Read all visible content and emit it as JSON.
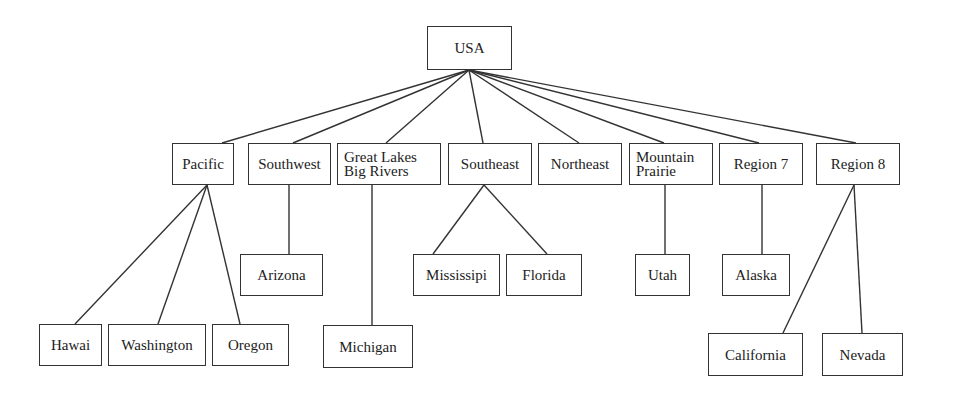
{
  "diagram": {
    "type": "tree",
    "root": "USA",
    "nodes": [
      {
        "id": "usa",
        "label": "USA",
        "x": 427,
        "y": 26,
        "w": 85,
        "h": 44
      },
      {
        "id": "pacific",
        "label": "Pacific",
        "x": 172,
        "y": 143,
        "w": 62,
        "h": 42
      },
      {
        "id": "southwest",
        "label": "Southwest",
        "x": 248,
        "y": 143,
        "w": 83,
        "h": 42
      },
      {
        "id": "greatlakes",
        "label": "Great Lakes",
        "label2": "Big Rivers",
        "x": 337,
        "y": 143,
        "w": 104,
        "h": 42
      },
      {
        "id": "southeast",
        "label": "Southeast",
        "x": 448,
        "y": 143,
        "w": 84,
        "h": 42
      },
      {
        "id": "northeast",
        "label": "Northeast",
        "x": 538,
        "y": 143,
        "w": 84,
        "h": 42
      },
      {
        "id": "mountain",
        "label": "Mountain",
        "label2": "Prairie",
        "x": 629,
        "y": 143,
        "w": 84,
        "h": 42
      },
      {
        "id": "region7",
        "label": "Region 7",
        "x": 719,
        "y": 143,
        "w": 84,
        "h": 42
      },
      {
        "id": "region8",
        "label": "Region 8",
        "x": 816,
        "y": 143,
        "w": 84,
        "h": 42
      },
      {
        "id": "arizona",
        "label": "Arizona",
        "x": 240,
        "y": 254,
        "w": 83,
        "h": 42
      },
      {
        "id": "mississipi",
        "label": "Mississipi",
        "x": 413,
        "y": 254,
        "w": 87,
        "h": 42
      },
      {
        "id": "florida",
        "label": "Florida",
        "x": 506,
        "y": 254,
        "w": 76,
        "h": 42
      },
      {
        "id": "utah",
        "label": "Utah",
        "x": 635,
        "y": 254,
        "w": 55,
        "h": 42
      },
      {
        "id": "alaska",
        "label": "Alaska",
        "x": 722,
        "y": 254,
        "w": 68,
        "h": 42
      },
      {
        "id": "hawai",
        "label": "Hawai",
        "x": 39,
        "y": 324,
        "w": 63,
        "h": 42
      },
      {
        "id": "washington",
        "label": "Washington",
        "x": 108,
        "y": 324,
        "w": 98,
        "h": 42
      },
      {
        "id": "oregon",
        "label": "Oregon",
        "x": 212,
        "y": 324,
        "w": 77,
        "h": 42
      },
      {
        "id": "michigan",
        "label": "Michigan",
        "x": 323,
        "y": 325,
        "w": 90,
        "h": 43
      },
      {
        "id": "california",
        "label": "California",
        "x": 708,
        "y": 333,
        "w": 95,
        "h": 43
      },
      {
        "id": "nevada",
        "label": "Nevada",
        "x": 822,
        "y": 333,
        "w": 81,
        "h": 43
      }
    ],
    "edges": [
      {
        "x1": 469,
        "y1": 70,
        "x2": 222,
        "y2": 143
      },
      {
        "x1": 469,
        "y1": 70,
        "x2": 293,
        "y2": 143
      },
      {
        "x1": 469,
        "y1": 70,
        "x2": 386,
        "y2": 143
      },
      {
        "x1": 469,
        "y1": 70,
        "x2": 483,
        "y2": 143
      },
      {
        "x1": 469,
        "y1": 70,
        "x2": 579,
        "y2": 143
      },
      {
        "x1": 469,
        "y1": 70,
        "x2": 664,
        "y2": 143
      },
      {
        "x1": 469,
        "y1": 70,
        "x2": 759,
        "y2": 143
      },
      {
        "x1": 469,
        "y1": 70,
        "x2": 856,
        "y2": 143
      },
      {
        "x1": 207,
        "y1": 185,
        "x2": 75,
        "y2": 324
      },
      {
        "x1": 207,
        "y1": 185,
        "x2": 158,
        "y2": 324
      },
      {
        "x1": 207,
        "y1": 185,
        "x2": 240,
        "y2": 324
      },
      {
        "x1": 289,
        "y1": 185,
        "x2": 289,
        "y2": 254
      },
      {
        "x1": 372,
        "y1": 185,
        "x2": 372,
        "y2": 325
      },
      {
        "x1": 484,
        "y1": 185,
        "x2": 433,
        "y2": 254
      },
      {
        "x1": 484,
        "y1": 185,
        "x2": 547,
        "y2": 254
      },
      {
        "x1": 665,
        "y1": 185,
        "x2": 665,
        "y2": 254
      },
      {
        "x1": 762,
        "y1": 185,
        "x2": 762,
        "y2": 254
      },
      {
        "x1": 854,
        "y1": 185,
        "x2": 783,
        "y2": 333
      },
      {
        "x1": 854,
        "y1": 185,
        "x2": 862,
        "y2": 333
      }
    ],
    "colors": {
      "stroke": "#333333",
      "background": "#ffffff",
      "text": "#222222"
    }
  }
}
